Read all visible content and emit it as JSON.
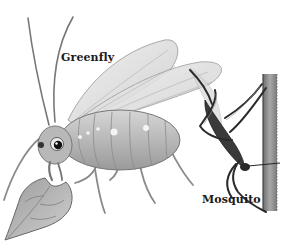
{
  "figure": {
    "labels": {
      "greenfly": "Greenfly",
      "mosquito": "Mosquito"
    },
    "subjects": [
      {
        "name": "greenfly",
        "description": "aphid feeding on leaf, wings raised"
      },
      {
        "name": "mosquito",
        "description": "mosquito clinging to plant stem"
      }
    ],
    "style": {
      "background": "#ffffff",
      "line_color": "#555555",
      "body_fill": "#bdbdbd",
      "wing_fill": "#e4e4e4",
      "mosquito_fill": "#2e2e2e",
      "stem_fill": "#8a8a8a"
    }
  }
}
